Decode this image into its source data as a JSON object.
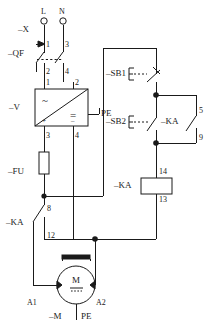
{
  "diagram": {
    "line_color": "#1a1a1a",
    "background_color": "#ffffff"
  },
  "terminal_block": {
    "ref": "–X",
    "terminals": [
      {
        "name": "terminal-L",
        "label": "L"
      },
      {
        "name": "terminal-N",
        "label": "N"
      }
    ]
  },
  "circuit_breaker": {
    "ref": "–QF",
    "type": "2-pole circuit breaker",
    "pins": {
      "in_1": "1",
      "out_2": "2",
      "in_3": "3",
      "out_4": "4"
    }
  },
  "power_supply": {
    "ref": "–V",
    "type": "AC/DC power supply",
    "ac_symbol": "~",
    "dc_symbol": "=",
    "earth_label": "PE",
    "pins": {
      "ac_in_1": "1",
      "ac_in_2": "2",
      "dc_out_3": "3",
      "dc_out_4": "4"
    },
    "polarity": {
      "positive": "+",
      "negative": "–"
    }
  },
  "fuse": {
    "ref": "–FU",
    "type": "fuse"
  },
  "relay_contact_main": {
    "ref": "–KA",
    "type": "normally open contact",
    "pins": {
      "top": "8",
      "bottom": "12"
    }
  },
  "stop_button": {
    "ref": "–SB1",
    "type": "normally closed pushbutton"
  },
  "start_button": {
    "ref": "–SB2",
    "type": "normally open pushbutton"
  },
  "relay_contact_hold": {
    "ref": "–KA",
    "type": "normally open holding contact",
    "pins": {
      "top": "5",
      "bottom": "9"
    }
  },
  "relay_coil": {
    "ref": "–KA",
    "type": "relay coil",
    "pins": {
      "top": "14",
      "bottom": "13"
    }
  },
  "motor": {
    "ref": "–M",
    "type": "DC motor",
    "symbol": "M",
    "dc_symbol": "=",
    "earth_label": "PE",
    "pins": {
      "left": "A1",
      "right": "A2"
    }
  }
}
